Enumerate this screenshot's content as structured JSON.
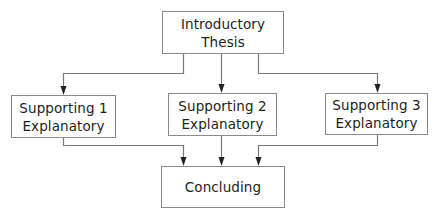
{
  "diagram": {
    "colors": {
      "line": "#7a7a7a",
      "arrow": "#222222",
      "box_border": "#8a8a8a",
      "text": "#1e1e1e",
      "background": "#ffffff"
    },
    "nodes": {
      "intro": {
        "line1": "Introductory",
        "line2": "Thesis"
      },
      "support1": {
        "line1": "Supporting 1",
        "line2": "Explanatory"
      },
      "support2": {
        "line1": "Supporting 2",
        "line2": "Explanatory"
      },
      "support3": {
        "line1": "Supporting 3",
        "line2": "Explanatory"
      },
      "conclusion": {
        "line1": "Concluding"
      }
    },
    "edges": [
      {
        "from": "intro",
        "to": "support1"
      },
      {
        "from": "intro",
        "to": "support2"
      },
      {
        "from": "intro",
        "to": "support3"
      },
      {
        "from": "support1",
        "to": "conclusion"
      },
      {
        "from": "support2",
        "to": "conclusion"
      },
      {
        "from": "support3",
        "to": "conclusion"
      }
    ]
  }
}
